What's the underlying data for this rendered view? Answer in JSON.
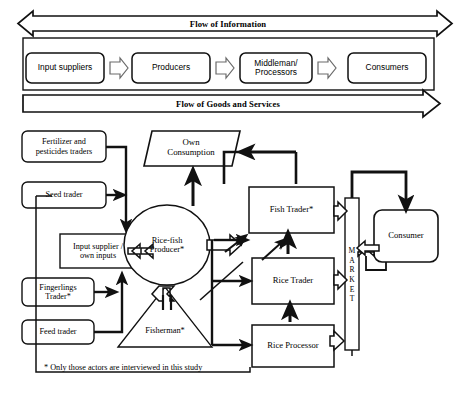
{
  "figure": {
    "title_top_band": "Flow of Information",
    "title_bottom_band": "Flow of Goods and Services",
    "footnote": "* Only those actors are interviewed in this study",
    "colors": {
      "background": "#ffffff",
      "stroke": "#111111",
      "text": "#111111",
      "chevron_stroke": "#5a5a5a"
    }
  },
  "value_chain_row": {
    "nodes": [
      {
        "id": "input-suppliers",
        "label": "Input suppliers",
        "shape": "rounded-rect"
      },
      {
        "id": "producers",
        "label": "Producers",
        "shape": "rounded-rect"
      },
      {
        "id": "middleman-processors",
        "label": "Middleman/\nProcessors",
        "shape": "rounded-rect"
      },
      {
        "id": "consumers",
        "label": "Consumers",
        "shape": "rounded-rect"
      }
    ],
    "connectors": [
      {
        "from": "input-suppliers",
        "to": "producers",
        "style": "hollow-chevron-right"
      },
      {
        "from": "producers",
        "to": "middleman-processors",
        "style": "hollow-chevron-right"
      },
      {
        "from": "middleman-processors",
        "to": "consumers",
        "style": "hollow-chevron-right"
      }
    ],
    "bands": [
      {
        "id": "flow-of-information",
        "label": "Flow of Information",
        "direction": "bidirectional"
      },
      {
        "id": "flow-of-goods-and-services",
        "label": "Flow of Goods and Services",
        "direction": "right"
      }
    ]
  },
  "actor_map": {
    "nodes": [
      {
        "id": "fertilizer-pesticides-traders",
        "label": "Fertilizer and\npesticides traders",
        "shape": "rounded-rect"
      },
      {
        "id": "seed-trader",
        "label": "Seed trader",
        "shape": "rounded-rect"
      },
      {
        "id": "input-supplier-own-inputs",
        "label": "Input supplier /\nown inputs",
        "shape": "rect"
      },
      {
        "id": "fingerlings-trader",
        "label": "Fingerlings\nTrader*",
        "shape": "rounded-rect"
      },
      {
        "id": "feed-trader",
        "label": "Feed trader",
        "shape": "rounded-rect"
      },
      {
        "id": "own-consumption",
        "label": "Own\nConsumption",
        "shape": "parallelogram"
      },
      {
        "id": "rice-fish-producer",
        "label": "Rice-fish\nProducer*",
        "shape": "ellipse"
      },
      {
        "id": "fisherman",
        "label": "Fisherman*",
        "shape": "triangle"
      },
      {
        "id": "fish-trader",
        "label": "Fish Trader*",
        "shape": "rect"
      },
      {
        "id": "rice-trader",
        "label": "Rice Trader",
        "shape": "rect"
      },
      {
        "id": "rice-processor",
        "label": "Rice Processor",
        "shape": "rect"
      },
      {
        "id": "market",
        "label": "MARKET",
        "shape": "vertical-rect",
        "orientation": "vertical"
      },
      {
        "id": "consumer",
        "label": "Consumer",
        "shape": "rounded-rect"
      }
    ],
    "edges": [
      {
        "from": "fertilizer-pesticides-traders",
        "to": "input-supplier-own-inputs"
      },
      {
        "from": "seed-trader",
        "to": "input-supplier-own-inputs"
      },
      {
        "from": "fingerlings-trader",
        "to": "input-supplier-own-inputs"
      },
      {
        "from": "feed-trader",
        "to": "input-supplier-own-inputs"
      },
      {
        "from": "input-supplier-own-inputs",
        "to": "rice-fish-producer"
      },
      {
        "from": "rice-fish-producer",
        "to": "own-consumption"
      },
      {
        "from": "rice-fish-producer",
        "to": "fish-trader"
      },
      {
        "from": "rice-fish-producer",
        "to": "rice-trader"
      },
      {
        "from": "rice-fish-producer",
        "to": "fisherman"
      },
      {
        "from": "fisherman",
        "to": "fish-trader"
      },
      {
        "from": "fish-trader",
        "to": "market"
      },
      {
        "from": "rice-trader",
        "to": "market"
      },
      {
        "from": "rice-processor",
        "to": "rice-trader"
      },
      {
        "from": "rice-processor",
        "to": "market"
      },
      {
        "from": "market",
        "to": "consumer"
      },
      {
        "from": "consumer",
        "to": "market"
      },
      {
        "from": "market",
        "to": "own-consumption"
      }
    ]
  }
}
